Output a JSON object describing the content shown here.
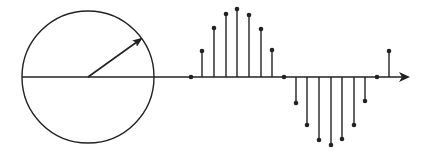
{
  "diagram": {
    "stroke_color": "#222222",
    "background": "#ffffff",
    "circle": {
      "cx": 88,
      "cy": 77,
      "r": 66
    },
    "phasor": {
      "x1": 88,
      "y1": 77,
      "x2": 141,
      "y2": 39
    },
    "axis": {
      "x1": 22,
      "y": 77,
      "x2": 410
    },
    "samples": [
      {
        "x": 191,
        "y": 77
      },
      {
        "x": 202,
        "y": 51
      },
      {
        "x": 214,
        "y": 28
      },
      {
        "x": 226,
        "y": 14
      },
      {
        "x": 237,
        "y": 9
      },
      {
        "x": 249,
        "y": 15
      },
      {
        "x": 261,
        "y": 29
      },
      {
        "x": 272,
        "y": 50
      },
      {
        "x": 284,
        "y": 77
      },
      {
        "x": 296,
        "y": 103
      },
      {
        "x": 307,
        "y": 125
      },
      {
        "x": 319,
        "y": 140
      },
      {
        "x": 331,
        "y": 145
      },
      {
        "x": 342,
        "y": 139
      },
      {
        "x": 354,
        "y": 125
      },
      {
        "x": 365,
        "y": 101
      },
      {
        "x": 377,
        "y": 77
      },
      {
        "x": 389,
        "y": 51
      }
    ]
  }
}
